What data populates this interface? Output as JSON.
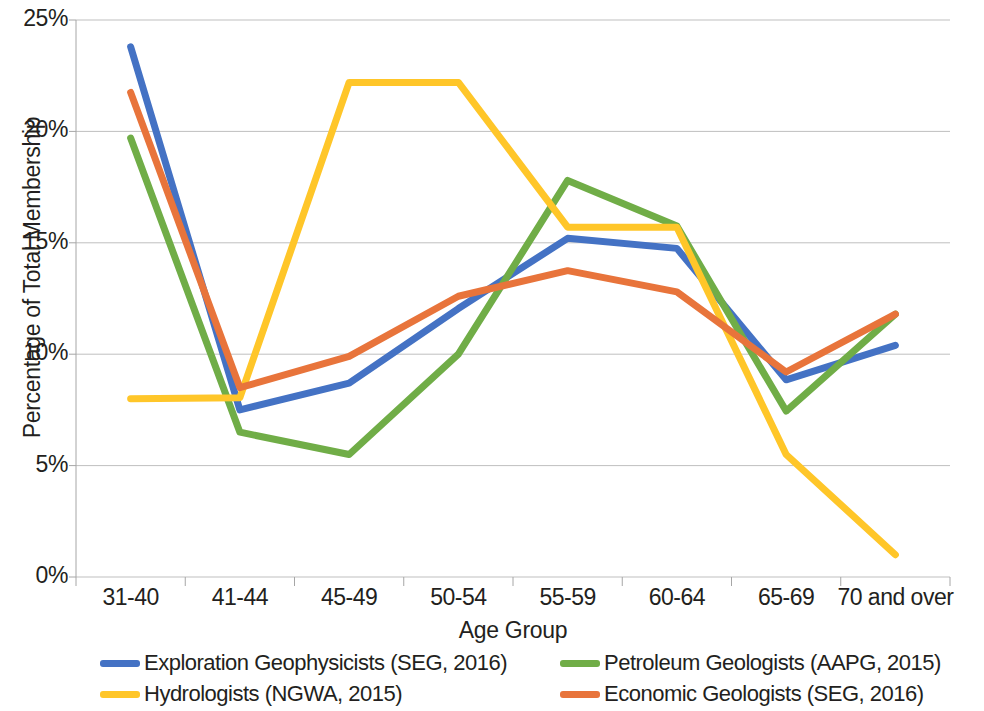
{
  "chart_data": {
    "type": "line",
    "title": "",
    "xlabel": "Age Group",
    "ylabel": "Percentage of Total Membership",
    "categories": [
      "31-40",
      "41-44",
      "45-49",
      "50-54",
      "55-59",
      "60-64",
      "65-69",
      "70 and over"
    ],
    "ylim": [
      0,
      25
    ],
    "ytick_values": [
      0,
      5,
      10,
      15,
      20,
      25
    ],
    "ytick_labels": [
      "0%",
      "5%",
      "10%",
      "15%",
      "20%",
      "25%"
    ],
    "grid": "horizontal",
    "legend_position": "bottom",
    "series": [
      {
        "name": "Exploration Geophysicists (SEG, 2016)",
        "color": "#4472C4",
        "values": [
          23.8,
          7.5,
          8.7,
          12.05,
          15.2,
          14.75,
          8.85,
          10.4
        ]
      },
      {
        "name": "Petroleum Geologists (AAPG, 2015)",
        "color": "#70AD47",
        "values": [
          19.7,
          6.5,
          5.5,
          10.0,
          17.8,
          15.75,
          7.45,
          11.8
        ]
      },
      {
        "name": "Hydrologists (NGWA, 2015)",
        "color": "#FFC629",
        "values": [
          8.0,
          8.05,
          22.2,
          22.2,
          15.7,
          15.7,
          5.5,
          1.0
        ]
      },
      {
        "name": "Economic Geologists (SEG, 2016)",
        "color": "#E8743B",
        "values": [
          21.75,
          8.5,
          9.9,
          12.6,
          13.75,
          12.8,
          9.2,
          11.8
        ]
      }
    ]
  },
  "axes": {
    "y_title": "Percentage of Total Membership",
    "x_title": "Age Group"
  },
  "colors": {
    "grid": "#BFBFBF",
    "axis": "#A6A6A6",
    "text": "#231f20"
  }
}
